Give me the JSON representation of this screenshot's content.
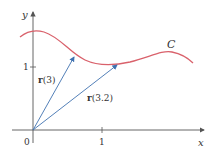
{
  "diagram": {
    "axes": {
      "x_label": "x",
      "y_label": "y",
      "origin_label": "0",
      "x_tick_label": "1",
      "y_tick_label": "1"
    },
    "curve": {
      "label": "C",
      "color": "#d9616b"
    },
    "vectors": [
      {
        "label_bold": "r",
        "label_arg": "(3)",
        "color": "#3f72b0"
      },
      {
        "label_bold": "r",
        "label_arg": "(3.2)",
        "color": "#3f72b0"
      }
    ]
  }
}
